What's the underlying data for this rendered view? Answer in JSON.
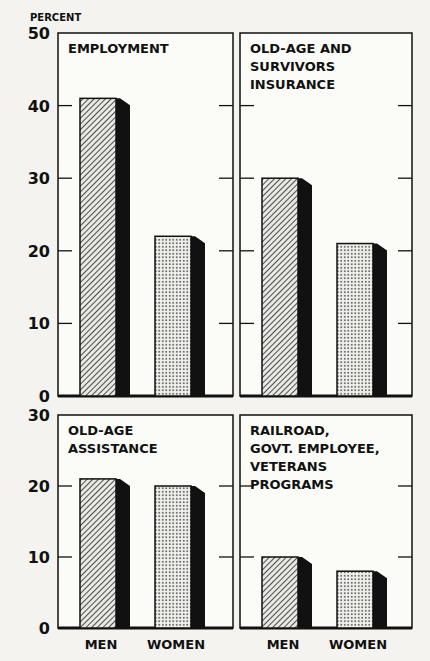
{
  "chart_data": [
    {
      "type": "bar",
      "title": "EMPLOYMENT",
      "title_lines": [
        "EMPLOYMENT"
      ],
      "categories": [
        "MEN",
        "WOMEN"
      ],
      "values": [
        41,
        22
      ],
      "ylabel": "PERCENT",
      "ylim": [
        0,
        50
      ],
      "yticks": [
        0,
        10,
        20,
        30,
        40,
        50
      ]
    },
    {
      "type": "bar",
      "title": "OLD-AGE AND SURVIVORS INSURANCE",
      "title_lines": [
        "OLD-AGE AND",
        "SURVIVORS",
        "INSURANCE"
      ],
      "categories": [
        "MEN",
        "WOMEN"
      ],
      "values": [
        30,
        21
      ],
      "ylim": [
        0,
        50
      ],
      "yticks": [
        0,
        10,
        20,
        30,
        40,
        50
      ]
    },
    {
      "type": "bar",
      "title": "OLD-AGE ASSISTANCE",
      "title_lines": [
        "OLD-AGE",
        "ASSISTANCE"
      ],
      "categories": [
        "MEN",
        "WOMEN"
      ],
      "values": [
        21,
        20
      ],
      "ylim": [
        0,
        30
      ],
      "yticks": [
        0,
        10,
        20,
        30
      ]
    },
    {
      "type": "bar",
      "title": "RAILROAD, GOVT. EMPLOYEE, VETERANS PROGRAMS",
      "title_lines": [
        "RAILROAD,",
        "GOVT. EMPLOYEE,",
        "VETERANS",
        "PROGRAMS"
      ],
      "categories": [
        "MEN",
        "WOMEN"
      ],
      "values": [
        10,
        8
      ],
      "ylim": [
        0,
        30
      ],
      "yticks": [
        0,
        10,
        20,
        30
      ]
    }
  ],
  "legend": {
    "men_pattern": "diagonal-hatch",
    "women_pattern": "dots"
  },
  "caption_fragment": "Women and..."
}
